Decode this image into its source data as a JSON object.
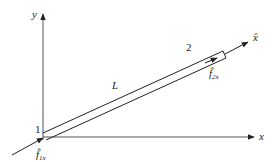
{
  "diagram": {
    "type": "truss bar element in local and global coordinates",
    "axes": {
      "x_label": "x",
      "y_label": "y",
      "local_axis_label": "x̂"
    },
    "nodes": [
      {
        "id": "1",
        "label": "1"
      },
      {
        "id": "2",
        "label": "2"
      }
    ],
    "element": {
      "length_label": "L"
    },
    "forces": [
      {
        "at_node": "1",
        "base": "f̂",
        "subscript": "1x"
      },
      {
        "at_node": "2",
        "base": "f̂",
        "subscript": "2x"
      }
    ],
    "colors": {
      "line": "#222222",
      "axis": "#555555",
      "background": "#ffffff"
    }
  }
}
